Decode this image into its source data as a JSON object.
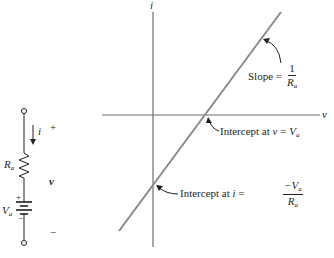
{
  "figure": {
    "colors": {
      "graph_line": "#8a8a8a",
      "axis": "#6e6e6e",
      "ink": "#231f20"
    },
    "axes": {
      "x_label": "v",
      "y_label": "i"
    },
    "annotations": {
      "slope": {
        "text": "Slope =",
        "num": "1",
        "den_main": "R",
        "den_sub": "a"
      },
      "v_intercept": {
        "text": "Intercept at ",
        "var": "v",
        "eq": " = ",
        "val_main": "V",
        "val_sub": "a"
      },
      "i_intercept": {
        "text": "Intercept at ",
        "var": "i",
        "eq": " = ",
        "num_main": "−V",
        "num_sub": "a",
        "den_main": "R",
        "den_sub": "a"
      }
    },
    "circuit": {
      "current_label": "i",
      "resistor_label_main": "R",
      "resistor_label_sub": "a",
      "voltage_label": "v",
      "source_label_main": "V",
      "source_label_sub": "a",
      "plus_top": "+",
      "minus_bottom": "−",
      "source_plus": "+",
      "source_minus": "−"
    }
  }
}
